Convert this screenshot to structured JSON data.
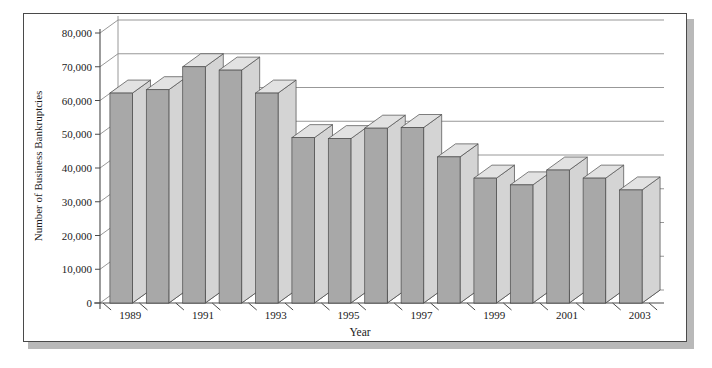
{
  "chart_data": {
    "type": "bar",
    "title": "",
    "subtitle": "",
    "xlabel": "Year",
    "ylabel": "Number of Business Bankruptcies",
    "categories": [
      "1989",
      "1990",
      "1991",
      "1992",
      "1993",
      "1994",
      "1995",
      "1996",
      "1997",
      "1998",
      "1999",
      "2000",
      "2001",
      "2002",
      "2003"
    ],
    "values": [
      62200,
      63200,
      70000,
      69000,
      62200,
      49000,
      48700,
      51800,
      52000,
      43300,
      37000,
      35000,
      39400,
      37000,
      33500
    ],
    "series": [
      {
        "name": "Number of Business Bankruptcies",
        "values": [
          62200,
          63200,
          70000,
          69000,
          62200,
          49000,
          48700,
          51800,
          52000,
          43300,
          37000,
          35000,
          39400,
          37000,
          33500
        ]
      }
    ],
    "ylim": [
      0,
      80000
    ],
    "ytick_values": [
      0,
      10000,
      20000,
      30000,
      40000,
      50000,
      60000,
      70000,
      80000
    ],
    "ytick_labels": [
      "0",
      "10,000",
      "20,000",
      "30,000",
      "40,000",
      "50,000",
      "60,000",
      "70,000",
      "80,000"
    ],
    "xtick_labels": [
      "1989",
      "1991",
      "1993",
      "1995",
      "1997",
      "1999",
      "2001",
      "2003"
    ],
    "xtick_categories": [
      "1989",
      "1991",
      "1993",
      "1995",
      "1997",
      "1999",
      "2001",
      "2003"
    ],
    "grid": true,
    "grid_axis": "y",
    "legend": false,
    "legend_position": "none",
    "style": "3d-column",
    "colors": {
      "bar_front": "#a8a8a8",
      "bar_side": "#d4d4d4",
      "bar_top": "#e2e2e2",
      "bar_outline": "#4a4a4a",
      "bar_base_shadow": "#111111",
      "gridline": "#8c8c8c",
      "axis": "#4a4a4a",
      "frame_border": "#4a4a4a",
      "frame_shadow": "#b9b9b9",
      "background": "#ffffff",
      "text": "#1a1a1a"
    }
  }
}
